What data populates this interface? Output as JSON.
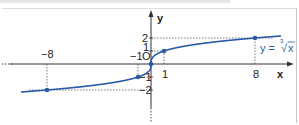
{
  "chart_data": {
    "type": "line",
    "title": "",
    "function_label": "y = ∛x",
    "function_label_parts": {
      "prefix": "y = ",
      "index": "3",
      "radical": "√",
      "radicand": "x"
    },
    "xlabel": "x",
    "ylabel": "y",
    "origin_label": "O",
    "x_ticks": [
      -8,
      -1,
      1,
      8
    ],
    "x_tick_labels": [
      "−8",
      "−1",
      "1",
      "8"
    ],
    "y_ticks": [
      2,
      1,
      -1,
      -2
    ],
    "y_tick_labels": [
      "2",
      "1",
      "−1",
      "−2"
    ],
    "xlim": [
      -11.5,
      10.5
    ],
    "ylim": [
      -3,
      3.5
    ],
    "grid": false,
    "series": [
      {
        "name": "y = ∛x",
        "x": [
          -8,
          -1,
          0,
          1,
          8
        ],
        "y": [
          -2,
          -1,
          0,
          1,
          2
        ],
        "color": "#2a5aa8",
        "marked_points": true
      }
    ],
    "reference_lines": "dotted projections from marked points to both axes"
  },
  "colors": {
    "curve": "#2a5aa8",
    "axis": "#333333",
    "dotted": "#555555"
  }
}
